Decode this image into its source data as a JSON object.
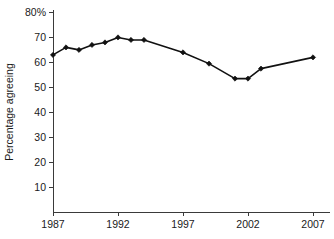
{
  "chart_data": {
    "type": "line",
    "title": "",
    "xlabel": "",
    "ylabel": "Percentage agreeing",
    "xlim": [
      1986.5,
      2007.5
    ],
    "ylim": [
      0,
      80
    ],
    "grid": false,
    "legend": false,
    "y_ticks": [
      10,
      20,
      30,
      40,
      50,
      60,
      70,
      80
    ],
    "y_tick_labels": [
      "10",
      "20",
      "30",
      "40",
      "50",
      "60",
      "70",
      "80%"
    ],
    "x_ticks": [
      1987,
      1992,
      1997,
      2002,
      2007
    ],
    "x_tick_labels": [
      "1987",
      "1992",
      "1997",
      "2002",
      "2007"
    ],
    "x": [
      1987,
      1988,
      1989,
      1990,
      1991,
      1992,
      1993,
      1994,
      1997,
      1999,
      2001,
      2002,
      2003,
      2007
    ],
    "values": [
      63,
      66,
      65,
      67,
      68,
      70,
      69,
      69,
      64,
      59.5,
      53.5,
      53.5,
      57.5,
      62
    ],
    "marker": "diamond",
    "line_color": "#111111",
    "marker_color": "#111111"
  },
  "axes": {
    "y_axis_title": "Percentage agreeing"
  }
}
